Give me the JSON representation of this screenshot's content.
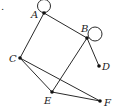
{
  "diagram": {
    "type": "graph",
    "marker": ".",
    "nodes": [
      {
        "id": "A",
        "label": "A",
        "x": 44,
        "y": 13,
        "lx": 31,
        "ly": 18
      },
      {
        "id": "B",
        "label": "B",
        "x": 87,
        "y": 38,
        "lx": 81,
        "ly": 32
      },
      {
        "id": "C",
        "label": "C",
        "x": 20,
        "y": 58,
        "lx": 9,
        "ly": 62
      },
      {
        "id": "D",
        "label": "D",
        "x": 99,
        "y": 66,
        "lx": 102,
        "ly": 70
      },
      {
        "id": "E",
        "label": "E",
        "x": 52,
        "y": 92,
        "lx": 44,
        "ly": 104
      },
      {
        "id": "F",
        "label": "F",
        "x": 100,
        "y": 101,
        "lx": 104,
        "ly": 106
      }
    ],
    "edges": [
      [
        "A",
        "B"
      ],
      [
        "A",
        "C"
      ],
      [
        "B",
        "E"
      ],
      [
        "B",
        "D"
      ],
      [
        "C",
        "E"
      ],
      [
        "C",
        "F"
      ],
      [
        "E",
        "F"
      ]
    ],
    "loops": [
      {
        "node": "A",
        "cx": 44,
        "cy": 6,
        "r": 6.5
      },
      {
        "node": "B",
        "cx": 95,
        "cy": 34,
        "r": 7
      }
    ]
  }
}
